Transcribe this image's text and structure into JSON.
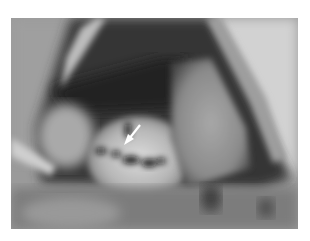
{
  "figure": {
    "kind": "grayscale intraoperative photograph",
    "annotation": {
      "type": "arrow",
      "color": "#ffffff",
      "direction": "down-left",
      "from": [
        140,
        125
      ],
      "to": [
        127,
        141
      ]
    },
    "palette": {
      "background": "#ffffff",
      "retractor_light": "#c8c8c8",
      "cavity_dark": "#2a2a2a",
      "tissue_mid": "#8c8c8c",
      "tissue_bright": "#d6d6d6",
      "lower_field": "#7a7a7a"
    }
  }
}
